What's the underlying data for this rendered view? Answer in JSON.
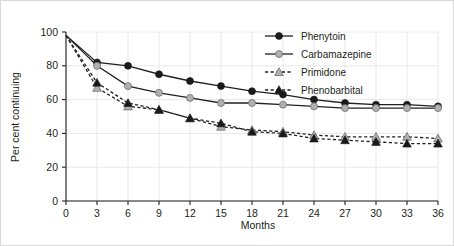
{
  "chart_data": {
    "type": "line",
    "title": "",
    "xlabel": "Months",
    "ylabel": "Per cent continuing",
    "xlim": [
      0,
      36
    ],
    "ylim": [
      0,
      100
    ],
    "xticks": [
      0,
      3,
      6,
      9,
      12,
      15,
      18,
      21,
      24,
      27,
      30,
      33,
      36
    ],
    "yticks": [
      0,
      20,
      40,
      60,
      80,
      100
    ],
    "xtick_labels": [
      "0",
      "3",
      "6",
      "9",
      "12",
      "15",
      "18",
      "21",
      "24",
      "27",
      "30",
      "33",
      "36"
    ],
    "ytick_labels": [
      "0",
      "20",
      "40",
      "60",
      "80",
      "100"
    ],
    "grid": true,
    "legend_position": "top-right",
    "x": [
      0,
      3,
      6,
      9,
      12,
      15,
      18,
      21,
      24,
      27,
      30,
      33,
      36
    ],
    "series": [
      {
        "name": "Phenytoin",
        "marker": "circle",
        "marker_color": "#1a1a1a",
        "line_style": "solid",
        "values": [
          98,
          82,
          80,
          75,
          71,
          68,
          65,
          63,
          60,
          58,
          57,
          57,
          56
        ]
      },
      {
        "name": "Carbamazepine",
        "marker": "circle",
        "marker_color": "#b0b0b0",
        "line_style": "solid",
        "values": [
          98,
          80,
          68,
          64,
          61,
          58,
          58,
          57,
          56,
          55,
          55,
          55,
          55
        ]
      },
      {
        "name": "Primidone",
        "marker": "triangle",
        "marker_color": "#b0b0b0",
        "line_style": "dashed",
        "values": [
          98,
          67,
          56,
          54,
          49,
          44,
          42,
          41,
          39,
          38,
          38,
          38,
          37
        ]
      },
      {
        "name": "Phenobarbital",
        "marker": "triangle",
        "marker_color": "#1a1a1a",
        "line_style": "dashed",
        "values": [
          98,
          70,
          58,
          54,
          49,
          46,
          41,
          40,
          37,
          36,
          35,
          34,
          34
        ]
      }
    ]
  },
  "legend": {
    "items": [
      {
        "label": "Phenytoin"
      },
      {
        "label": "Carbamazepine"
      },
      {
        "label": "Primidone"
      },
      {
        "label": "Phenobarbital"
      }
    ]
  },
  "colors": {
    "dark_marker": "#1a1a1a",
    "light_marker": "#b0b0b0",
    "line": "#231f20",
    "gridline": "#e8e8e8",
    "frame": "#d8d8d8",
    "text": "#231f20"
  }
}
